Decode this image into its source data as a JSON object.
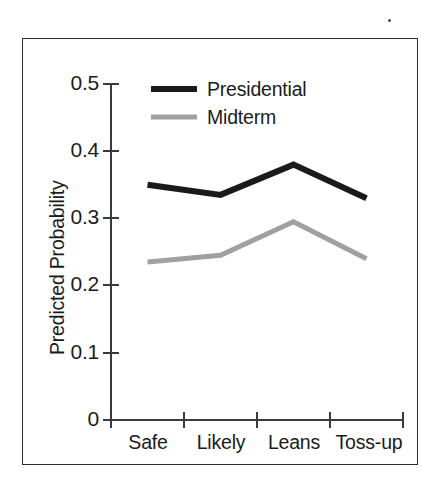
{
  "figure": {
    "background_color": "#ffffff",
    "frame_color": "#2b2b2b",
    "speck_name": "stray-ink-speck"
  },
  "chart_data": {
    "type": "line",
    "title": "",
    "xlabel": "",
    "ylabel": "Predicted Probability",
    "categories": [
      "Safe",
      "Likely",
      "Leans",
      "Toss-up"
    ],
    "series": [
      {
        "name": "Presidential",
        "color": "#1a1a1a",
        "values": [
          0.35,
          0.335,
          0.38,
          0.33
        ]
      },
      {
        "name": "Midterm",
        "color": "#a0a0a0",
        "values": [
          0.235,
          0.245,
          0.295,
          0.24
        ]
      }
    ],
    "ylim": [
      0,
      0.5
    ],
    "ytick_labels": [
      "0.5",
      "0.4",
      "0.3",
      "0.2",
      "0.1",
      "0"
    ],
    "ytick_values": [
      0.5,
      0.4,
      0.3,
      0.2,
      0.1,
      0
    ],
    "grid": false,
    "legend_position": "top-center"
  },
  "axis": {
    "y_title": "Predicted Probability",
    "ticks": {
      "t0": "0.5",
      "t1": "0.4",
      "t2": "0.3",
      "t3": "0.2",
      "t4": "0.1",
      "t5": "0"
    },
    "categories": {
      "c0": "Safe",
      "c1": "Likely",
      "c2": "Leans",
      "c3": "Toss-up"
    }
  },
  "legend": {
    "entries": {
      "e0": "Presidential",
      "e1": "Midterm"
    },
    "colors": {
      "e0": "#1a1a1a",
      "e1": "#a0a0a0"
    }
  }
}
